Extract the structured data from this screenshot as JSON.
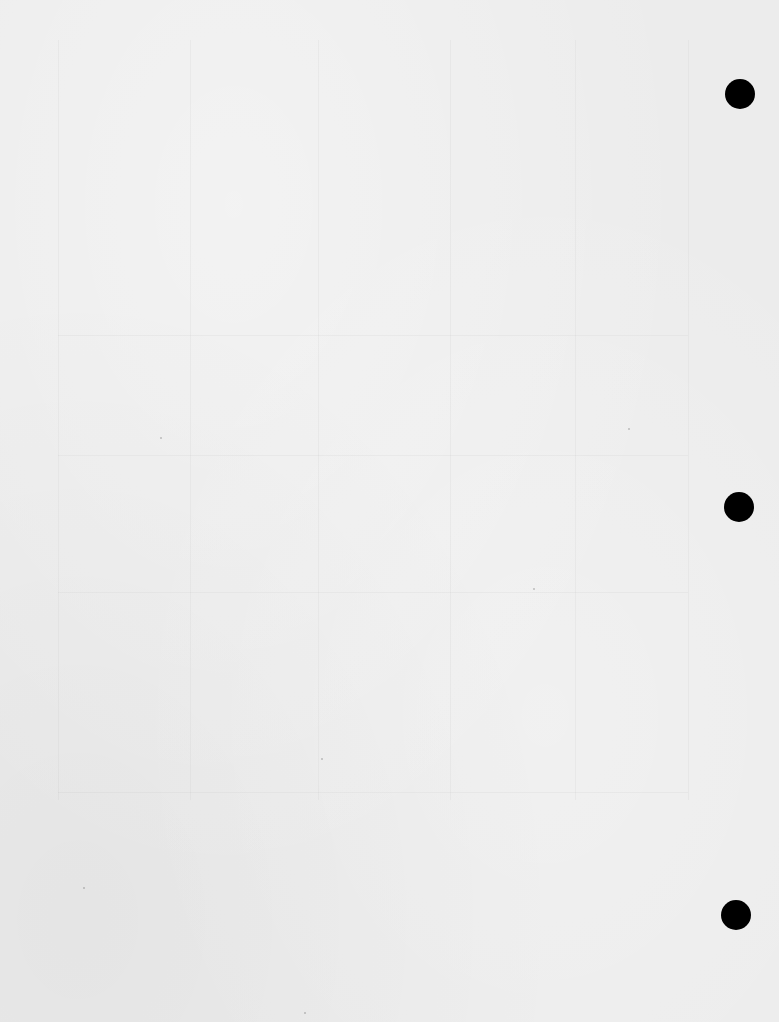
{
  "document": {
    "type": "blank scanned page",
    "text_content": "",
    "paper_color": "#ececec",
    "punch_holes": [
      {
        "cx": 740,
        "cy": 94,
        "r": 15
      },
      {
        "cx": 739,
        "cy": 507,
        "r": 15
      },
      {
        "cx": 736,
        "cy": 915,
        "r": 15
      }
    ],
    "hole_color": "#000000"
  }
}
